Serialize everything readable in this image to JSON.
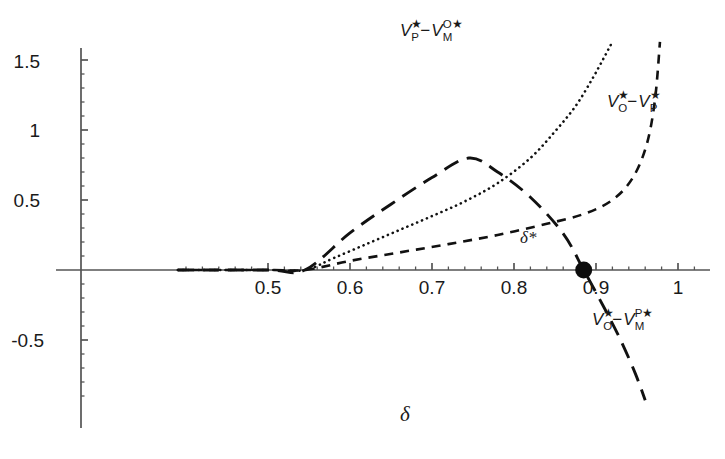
{
  "chart_data": {
    "type": "line",
    "title": "",
    "xlabel": "δ",
    "ylabel": "",
    "xlim": [
      0.39,
      1.06
    ],
    "ylim": [
      -0.92,
      1.62
    ],
    "grid": false,
    "legend": "inline-annotations",
    "xticks_major": [
      0.5,
      0.6,
      0.7,
      0.8,
      0.9,
      1
    ],
    "xtick_labels": [
      "0.5",
      "0.6",
      "0.7",
      "0.8",
      "0.9",
      "1"
    ],
    "xticks_minor_step": 0.02,
    "yticks_major": [
      1.5,
      1,
      0.5,
      -0.5
    ],
    "ytick_labels": [
      "1.5",
      "1",
      "0.5",
      "-0.5"
    ],
    "yticks_minor_step": 0.1,
    "branch_point": 0.545,
    "annotations": [
      {
        "name": "delta-star-marker",
        "label": "δ*",
        "x": 0.885,
        "y": 0.0,
        "marker": "filled-circle"
      }
    ],
    "series": [
      {
        "name": "VP* - VM^O*",
        "label_parts": {
          "v1": "V",
          "v1_sup": "★",
          "v1_sub": "P",
          "op": "−",
          "v2": "V",
          "v2_sup": "O★",
          "v2_sub": "M"
        },
        "style": "dotted",
        "label_x": 0.858,
        "label_y": 1.565,
        "x": [
          0.39,
          0.5,
          0.545,
          0.58,
          0.62,
          0.66,
          0.7,
          0.74,
          0.78,
          0.82,
          0.85,
          0.875,
          0.895,
          0.91,
          0.92
        ],
        "y": [
          0.0,
          0.0,
          0.0,
          0.085,
          0.185,
          0.285,
          0.385,
          0.49,
          0.62,
          0.8,
          0.99,
          1.17,
          1.36,
          1.52,
          1.63
        ]
      },
      {
        "name": "VO* - VP*",
        "label_parts": {
          "v1": "V",
          "v1_sup": "★",
          "v1_sub": "O",
          "op": "−",
          "v2": "V",
          "v2_sup": "★",
          "v2_sub": "P"
        },
        "style": "dashed-short",
        "label_x": 0.967,
        "label_y": 1.075,
        "x": [
          0.39,
          0.5,
          0.545,
          0.6,
          0.66,
          0.72,
          0.78,
          0.84,
          0.885,
          0.92,
          0.945,
          0.962,
          0.972,
          0.978
        ],
        "y": [
          0.0,
          0.0,
          0.0,
          0.065,
          0.125,
          0.185,
          0.25,
          0.33,
          0.4,
          0.5,
          0.66,
          0.9,
          1.22,
          1.63
        ]
      },
      {
        "name": "VO* - VM^P*",
        "label_parts": {
          "v1": "V",
          "v1_sup": "★",
          "v1_sub": "O",
          "op": "−",
          "v2": "V",
          "v2_sup": "P★",
          "v2_sub": "M"
        },
        "style": "dashed-long",
        "label_x": 0.962,
        "label_y": -0.41,
        "x": [
          0.39,
          0.5,
          0.545,
          0.6,
          0.65,
          0.7,
          0.745,
          0.78,
          0.82,
          0.86,
          0.885,
          0.91,
          0.93,
          0.948,
          0.96
        ],
        "y": [
          0.0,
          0.0,
          0.0,
          0.265,
          0.47,
          0.66,
          0.8,
          0.7,
          0.52,
          0.26,
          0.0,
          -0.27,
          -0.5,
          -0.74,
          -0.93
        ]
      }
    ]
  },
  "axis": {
    "x_label": "δ",
    "y_label": ""
  }
}
